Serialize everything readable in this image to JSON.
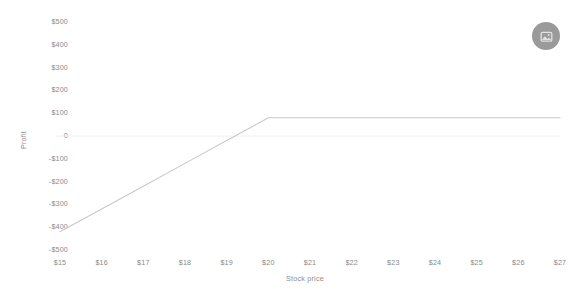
{
  "chart_data": {
    "type": "line",
    "title": "",
    "subtitle": "",
    "xlabel": "Stock price",
    "ylabel": "Profit",
    "xlim": [
      14.5,
      27.5
    ],
    "ylim": [
      -500,
      500
    ],
    "grid": false,
    "zero_line": true,
    "legend": "none",
    "line_color": "#c9c9c9",
    "x_tick_labels": [
      "$15",
      "$16",
      "$17",
      "$18",
      "$19",
      "$20",
      "$21",
      "$22",
      "$23",
      "$24",
      "$25",
      "$26",
      "$27"
    ],
    "x_tick_values": [
      15,
      16,
      17,
      18,
      19,
      20,
      21,
      22,
      23,
      24,
      25,
      26,
      27
    ],
    "y_tick_labels": [
      "$500",
      "$400",
      "$300",
      "$200",
      "$100",
      "0",
      "-$100",
      "-$200",
      "-$300",
      "-$400",
      "-$500"
    ],
    "y_tick_values": [
      500,
      400,
      300,
      200,
      100,
      0,
      -100,
      -200,
      -300,
      -400,
      -500
    ],
    "series": [
      {
        "name": "Profit",
        "x": [
          15,
          16,
          17,
          18,
          19,
          20,
          21,
          22,
          23,
          24,
          25,
          26,
          27
        ],
        "values": [
          -420,
          -320,
          -220,
          -120,
          -20,
          80,
          80,
          80,
          80,
          80,
          80,
          80,
          80
        ]
      }
    ],
    "breakpoint_x": 20,
    "breakpoint_y": 80,
    "breakeven_x": 19.2
  },
  "toolbar": {
    "export_icon": "image-export-icon",
    "export_label": ""
  }
}
